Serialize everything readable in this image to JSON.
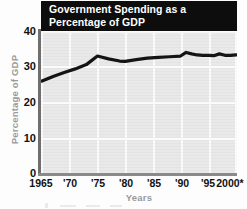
{
  "chart_data": {
    "type": "line",
    "title": "Government Spending as a Percentage of GDP",
    "title_line1": "Government Spending as a",
    "title_line2": "Percentage of GDP",
    "xlabel": "Years",
    "ylabel": "Percentage of GDP",
    "xlim": [
      1965,
      2000
    ],
    "ylim": [
      0,
      40
    ],
    "ytick_labels": [
      "40",
      "30",
      "20",
      "10",
      "0"
    ],
    "ytick_values": [
      40,
      30,
      20,
      10,
      0
    ],
    "xtick_labels": [
      "1965",
      "'70",
      "'75",
      "'80",
      "'85",
      "'90",
      "'95",
      "2000*"
    ],
    "xtick_values": [
      1965,
      1970,
      1975,
      1980,
      1985,
      1990,
      1995,
      2000
    ],
    "grid": true,
    "legend": null,
    "series": [
      {
        "name": "Government spending as a percentage of GDP",
        "x": [
          1965,
          1967,
          1969,
          1971,
          1973,
          1975,
          1977,
          1979,
          1980,
          1982,
          1984,
          1986,
          1988,
          1990,
          1991,
          1992,
          1993,
          1994,
          1995,
          1996,
          1997,
          1998,
          1999,
          2000
        ],
        "values": [
          26.0,
          27.3,
          28.4,
          29.4,
          30.6,
          33.0,
          32.2,
          31.6,
          31.5,
          32.0,
          32.4,
          32.6,
          32.8,
          33.0,
          34.0,
          33.6,
          33.3,
          33.2,
          33.2,
          33.1,
          33.6,
          33.2,
          33.2,
          33.3
        ]
      }
    ],
    "colors": {
      "line": "#111111",
      "plot_background": "#e9e9e9",
      "gridline": "#fbfbfb",
      "title_background": "#0d0d0d",
      "title_text": "#ffffff",
      "axis_title_text": "#9a9a9a",
      "tick_text": "#111111"
    }
  }
}
